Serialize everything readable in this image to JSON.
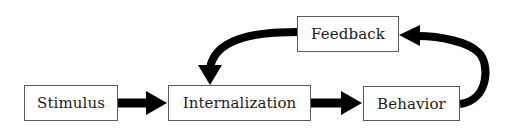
{
  "diagram": {
    "type": "flowchart",
    "nodes": [
      {
        "id": "stimulus",
        "label": "Stimulus"
      },
      {
        "id": "internalization",
        "label": "Internalization"
      },
      {
        "id": "behavior",
        "label": "Behavior"
      },
      {
        "id": "feedback",
        "label": "Feedback"
      }
    ],
    "edges": [
      {
        "from": "stimulus",
        "to": "internalization"
      },
      {
        "from": "internalization",
        "to": "behavior"
      },
      {
        "from": "behavior",
        "to": "feedback"
      },
      {
        "from": "feedback",
        "to": "internalization"
      }
    ],
    "colors": {
      "arrow": "#000000",
      "box_border": "#5a5a5a",
      "text": "#1c1c1c",
      "background": "#ffffff"
    }
  }
}
